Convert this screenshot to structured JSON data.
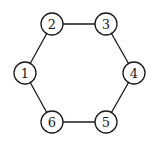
{
  "graph": {
    "type": "cycle",
    "nodes": [
      {
        "id": "1",
        "label": "1",
        "x": 25,
        "y": 73
      },
      {
        "id": "2",
        "label": "2",
        "x": 52,
        "y": 24
      },
      {
        "id": "3",
        "label": "3",
        "x": 106,
        "y": 24
      },
      {
        "id": "4",
        "label": "4",
        "x": 134,
        "y": 73
      },
      {
        "id": "5",
        "label": "5",
        "x": 106,
        "y": 122
      },
      {
        "id": "6",
        "label": "6",
        "x": 52,
        "y": 122
      }
    ],
    "edges": [
      [
        "1",
        "2"
      ],
      [
        "2",
        "3"
      ],
      [
        "3",
        "4"
      ],
      [
        "4",
        "5"
      ],
      [
        "5",
        "6"
      ],
      [
        "6",
        "1"
      ]
    ],
    "node_radius": 11,
    "colors": {
      "stroke": "#1a1a1a",
      "fill": "#ffffff",
      "background": "#ffffff"
    }
  }
}
